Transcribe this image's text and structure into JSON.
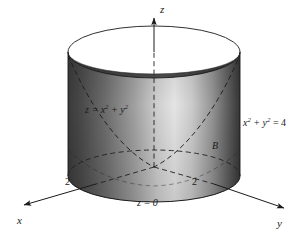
{
  "figure": {
    "background_color": "#ffffff",
    "ink_color": "#1a1a1a"
  },
  "axes": {
    "z": {
      "label": "z",
      "direction": "up",
      "arrow": true,
      "hidden_segment": "dashed"
    },
    "x": {
      "label": "x",
      "direction": "down-left",
      "arrow": true
    },
    "y": {
      "label": "y",
      "direction": "down-right",
      "arrow": true
    }
  },
  "ticks": [
    {
      "axis": "x",
      "value": "2"
    },
    {
      "axis": "y",
      "value": "2"
    }
  ],
  "annotations": {
    "paraboloid": {
      "base": "z = x",
      "exp1": "2",
      "mid": " + y",
      "exp2": "2"
    },
    "cylinder": {
      "base": "x",
      "exp1": "2",
      "mid": " + y",
      "exp2": "2",
      "tail": " = 4"
    },
    "region": {
      "label": "B"
    },
    "plane": {
      "label": "z = 0"
    }
  },
  "surfaces": {
    "cylinder": {
      "radius_label": "2",
      "shading": "vertical-gradient",
      "gradient_stops": [
        "#3b3b3b",
        "#4f4f4f",
        "#7a7a7a",
        "#c9c9c9",
        "#e2e2e2",
        "#bdbdbd",
        "#8d8d8d",
        "#4a4a4a",
        "#2f2f2f"
      ],
      "top_rim": "open-ellipse",
      "interior_color": "#3a3a3a"
    },
    "paraboloid": {
      "style": "dashed",
      "opens": "upward"
    },
    "base_circle": {
      "style": "dashed"
    }
  },
  "colors": {
    "stroke": "#1a1a1a",
    "dash": "#2a2a2a",
    "cylinder_dark": "#3b3b3b",
    "cylinder_light": "#e6e6e6",
    "interior_dark": "#373737"
  }
}
